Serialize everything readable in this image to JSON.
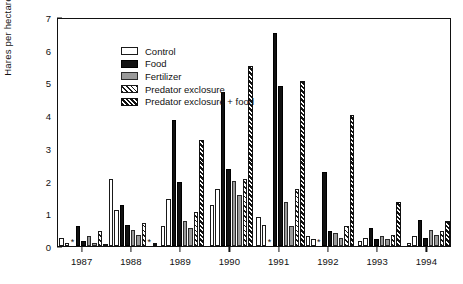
{
  "chart_data": {
    "type": "bar",
    "title": "",
    "xlabel": "",
    "ylabel": "Hares per hectare",
    "ylim": [
      0,
      7
    ],
    "yticks": [
      0,
      1,
      2,
      3,
      4,
      5,
      6,
      7
    ],
    "grid": false,
    "legend_position": "top-left",
    "categories": [
      "1987",
      "1988",
      "1989",
      "1990",
      "1991",
      "1992",
      "1993",
      "1994"
    ],
    "treatments": [
      "Control",
      "Food",
      "Fertilizer",
      "Predator exclosure",
      "Predator exclosure + food"
    ],
    "series": [
      {
        "name": "Control",
        "values": [
          0.25,
          2.05,
          0.6,
          1.25,
          0.9,
          0.3,
          0.15,
          0.1
        ]
      },
      {
        "name": "Control (replicate 2)",
        "values": [
          0.1,
          1.1,
          1.45,
          1.75,
          0.65,
          0.2,
          0.25,
          0.3
        ]
      },
      {
        "name": "Food",
        "values": [
          0.6,
          1.25,
          3.85,
          4.7,
          6.5,
          2.25,
          0.55,
          0.8
        ]
      },
      {
        "name": "Food (replicate 2)",
        "values": [
          0.15,
          0.65,
          1.95,
          2.35,
          4.9,
          0.45,
          0.2,
          0.25
        ]
      },
      {
        "name": "Fertilizer",
        "values": [
          0.3,
          0.5,
          0.75,
          2.0,
          1.35,
          0.4,
          0.3,
          0.5
        ]
      },
      {
        "name": "Fertilizer (replicate 2)",
        "values": [
          0.1,
          0.35,
          0.55,
          1.55,
          0.6,
          0.25,
          0.2,
          0.35
        ]
      },
      {
        "name": "Predator exclosure",
        "values": [
          0.45,
          0.7,
          1.05,
          2.05,
          1.75,
          0.6,
          0.35,
          0.45
        ]
      },
      {
        "name": "Predator exclosure + food",
        "values": [
          0.05,
          0.1,
          3.25,
          5.5,
          5.05,
          4.0,
          1.35,
          0.75
        ]
      }
    ],
    "annotations": [
      {
        "symbol": "*",
        "year": "1987",
        "note": "significance marker"
      },
      {
        "symbol": "*",
        "year": "1988",
        "note": "significance marker"
      },
      {
        "symbol": "*",
        "year": "1991",
        "note": "significance marker"
      },
      {
        "symbol": "*",
        "year": "1992",
        "note": "significance marker"
      }
    ],
    "groups": [
      {
        "year": "1987",
        "bars": [
          {
            "t": "control",
            "v": 0.25
          },
          {
            "t": "control",
            "v": 0.1
          },
          {
            "t": "star",
            "v": 0.06
          },
          {
            "t": "food",
            "v": 0.6
          },
          {
            "t": "food",
            "v": 0.15
          },
          {
            "t": "fert",
            "v": 0.3
          },
          {
            "t": "fert",
            "v": 0.1
          },
          {
            "t": "excl",
            "v": 0.45
          },
          {
            "t": "exclfood",
            "v": 0.05
          }
        ]
      },
      {
        "year": "1988",
        "bars": [
          {
            "t": "control",
            "v": 2.05
          },
          {
            "t": "control",
            "v": 1.1
          },
          {
            "t": "food",
            "v": 1.25
          },
          {
            "t": "food",
            "v": 0.65
          },
          {
            "t": "fert",
            "v": 0.5
          },
          {
            "t": "fert",
            "v": 0.35
          },
          {
            "t": "excl",
            "v": 0.7
          },
          {
            "t": "star",
            "v": 0.06
          },
          {
            "t": "exclfood",
            "v": 0.1
          }
        ]
      },
      {
        "year": "1989",
        "bars": [
          {
            "t": "control",
            "v": 0.6
          },
          {
            "t": "control",
            "v": 1.45
          },
          {
            "t": "food",
            "v": 3.85
          },
          {
            "t": "food",
            "v": 1.95
          },
          {
            "t": "fert",
            "v": 0.75
          },
          {
            "t": "fert",
            "v": 0.55
          },
          {
            "t": "excl",
            "v": 1.05
          },
          {
            "t": "exclfood",
            "v": 3.25
          }
        ]
      },
      {
        "year": "1990",
        "bars": [
          {
            "t": "control",
            "v": 1.25
          },
          {
            "t": "control",
            "v": 1.75
          },
          {
            "t": "food",
            "v": 4.7
          },
          {
            "t": "food",
            "v": 2.35
          },
          {
            "t": "fert",
            "v": 2.0
          },
          {
            "t": "fert",
            "v": 1.55
          },
          {
            "t": "excl",
            "v": 2.05
          },
          {
            "t": "exclfood",
            "v": 5.5
          }
        ]
      },
      {
        "year": "1991",
        "bars": [
          {
            "t": "control",
            "v": 0.9
          },
          {
            "t": "control",
            "v": 0.65
          },
          {
            "t": "star",
            "v": 0.06
          },
          {
            "t": "food",
            "v": 6.5
          },
          {
            "t": "food",
            "v": 4.9
          },
          {
            "t": "fert",
            "v": 1.35
          },
          {
            "t": "fert",
            "v": 0.6
          },
          {
            "t": "excl",
            "v": 1.75
          },
          {
            "t": "exclfood",
            "v": 5.05
          }
        ]
      },
      {
        "year": "1992",
        "bars": [
          {
            "t": "control",
            "v": 0.3
          },
          {
            "t": "control",
            "v": 0.2
          },
          {
            "t": "star",
            "v": 0.06
          },
          {
            "t": "food",
            "v": 2.25
          },
          {
            "t": "food",
            "v": 0.45
          },
          {
            "t": "fert",
            "v": 0.4
          },
          {
            "t": "fert",
            "v": 0.25
          },
          {
            "t": "excl",
            "v": 0.6
          },
          {
            "t": "exclfood",
            "v": 4.0
          }
        ]
      },
      {
        "year": "1993",
        "bars": [
          {
            "t": "control",
            "v": 0.15
          },
          {
            "t": "control",
            "v": 0.25
          },
          {
            "t": "food",
            "v": 0.55
          },
          {
            "t": "food",
            "v": 0.2
          },
          {
            "t": "fert",
            "v": 0.3
          },
          {
            "t": "fert",
            "v": 0.2
          },
          {
            "t": "excl",
            "v": 0.35
          },
          {
            "t": "exclfood",
            "v": 1.35
          }
        ]
      },
      {
        "year": "1994",
        "bars": [
          {
            "t": "control",
            "v": 0.1
          },
          {
            "t": "control",
            "v": 0.3
          },
          {
            "t": "food",
            "v": 0.8
          },
          {
            "t": "food",
            "v": 0.25
          },
          {
            "t": "fert",
            "v": 0.5
          },
          {
            "t": "fert",
            "v": 0.35
          },
          {
            "t": "excl",
            "v": 0.45
          },
          {
            "t": "exclfood",
            "v": 0.75
          }
        ]
      }
    ]
  },
  "legend": {
    "items": [
      {
        "label": "Control",
        "swatch": "control",
        "color": "#ffffff"
      },
      {
        "label": "Food",
        "swatch": "food",
        "color": "#111111"
      },
      {
        "label": "Fertilizer",
        "swatch": "fert",
        "color": "#9a9a9a"
      },
      {
        "label": "Predator exclosure",
        "swatch": "excl",
        "color": "#1a1a1a"
      },
      {
        "label": "Predator exclosure + food",
        "swatch": "exclfood",
        "color": "#111111"
      }
    ]
  }
}
